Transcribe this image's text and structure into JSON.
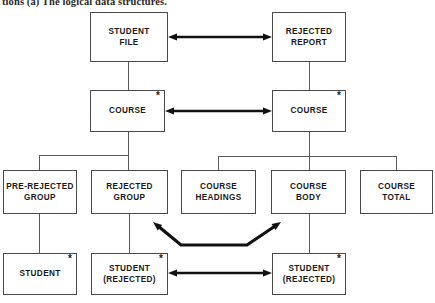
{
  "caption": "tions (a) The logical data structures.",
  "diagram": {
    "title": "The logical data structures",
    "type": "jackson-structure-diagram",
    "star_glyph": "*",
    "colors": {
      "box_border": "#4a4a4a",
      "wire": "#5a5a5a",
      "arrow": "#111111",
      "text": "#1a1a1a",
      "background": "#ffffff"
    },
    "nodes": [
      {
        "id": "student-file",
        "label_lines": [
          "STUDENT",
          "FILE"
        ],
        "star": false,
        "x": 90,
        "y": 12,
        "w": 78,
        "h": 50
      },
      {
        "id": "rejected-report",
        "label_lines": [
          "REJECTED",
          "REPORT"
        ],
        "star": false,
        "x": 272,
        "y": 12,
        "w": 74,
        "h": 50
      },
      {
        "id": "course-left",
        "label_lines": [
          "COURSE"
        ],
        "star": true,
        "x": 90,
        "y": 90,
        "w": 75,
        "h": 42
      },
      {
        "id": "course-right",
        "label_lines": [
          "COURSE"
        ],
        "star": true,
        "x": 272,
        "y": 90,
        "w": 74,
        "h": 42
      },
      {
        "id": "pre-rejected-group",
        "label_lines": [
          "PRE-REJECTED",
          "GROUP"
        ],
        "star": false,
        "x": 3,
        "y": 170,
        "w": 74,
        "h": 44
      },
      {
        "id": "rejected-group",
        "label_lines": [
          "REJECTED",
          "GROUP"
        ],
        "star": false,
        "x": 91,
        "y": 170,
        "w": 77,
        "h": 44
      },
      {
        "id": "course-headings",
        "label_lines": [
          "COURSE",
          "HEADINGS"
        ],
        "star": false,
        "x": 181,
        "y": 170,
        "w": 75,
        "h": 44
      },
      {
        "id": "course-body",
        "label_lines": [
          "COURSE",
          "BODY"
        ],
        "star": false,
        "x": 271,
        "y": 170,
        "w": 75,
        "h": 44
      },
      {
        "id": "course-total",
        "label_lines": [
          "COURSE",
          "TOTAL"
        ],
        "star": false,
        "x": 360,
        "y": 170,
        "w": 73,
        "h": 44
      },
      {
        "id": "student",
        "label_lines": [
          "STUDENT"
        ],
        "star": true,
        "x": 3,
        "y": 253,
        "w": 74,
        "h": 42
      },
      {
        "id": "student-rejected-l",
        "label_lines": [
          "STUDENT",
          "(REJECTED)"
        ],
        "star": true,
        "x": 91,
        "y": 253,
        "w": 77,
        "h": 42
      },
      {
        "id": "student-rejected-r",
        "label_lines": [
          "STUDENT",
          "(REJECTED)"
        ],
        "star": true,
        "x": 272,
        "y": 253,
        "w": 74,
        "h": 42
      }
    ],
    "arrows": [
      {
        "id": "arrow-student-file-rejected-report",
        "from": "student-file",
        "to": "rejected-report",
        "style": "straight-double",
        "x1": 168,
        "y1": 37,
        "x2": 272,
        "y2": 37
      },
      {
        "id": "arrow-course-course",
        "from": "course-left",
        "to": "course-right",
        "style": "straight-double",
        "x1": 165,
        "y1": 111,
        "x2": 272,
        "y2": 111
      },
      {
        "id": "arrow-student-rejected-pair",
        "from": "student-rejected-l",
        "to": "student-rejected-r",
        "style": "straight-double",
        "x1": 168,
        "y1": 273,
        "x2": 272,
        "y2": 273
      },
      {
        "id": "arrow-rejected-group-course-body",
        "from": "rejected-group",
        "to": "course-body",
        "style": "bent-double",
        "points": "153,222 181,245 247,245 281,222"
      }
    ],
    "connectors": [
      {
        "id": "wire-student-file-down",
        "type": "v",
        "x": 128,
        "y": 62,
        "len": 28
      },
      {
        "id": "wire-rejected-report-down",
        "type": "v",
        "x": 309,
        "y": 62,
        "len": 28
      },
      {
        "id": "wire-course-left-down",
        "type": "v",
        "x": 128,
        "y": 132,
        "len": 38
      },
      {
        "id": "wire-course-left-bus",
        "type": "h",
        "x": 39,
        "y": 155,
        "len": 89
      },
      {
        "id": "wire-pre-rejected-group-up",
        "type": "v",
        "x": 39,
        "y": 155,
        "len": 15
      },
      {
        "id": "wire-course-right-down",
        "type": "v",
        "x": 309,
        "y": 132,
        "len": 38
      },
      {
        "id": "wire-course-right-bus",
        "type": "h",
        "x": 218,
        "y": 156,
        "len": 178
      },
      {
        "id": "wire-course-headings-up",
        "type": "v",
        "x": 218,
        "y": 156,
        "len": 14
      },
      {
        "id": "wire-course-total-up",
        "type": "v",
        "x": 396,
        "y": 156,
        "len": 14
      },
      {
        "id": "wire-pre-rejected-to-student",
        "type": "v",
        "x": 39,
        "y": 214,
        "len": 39
      },
      {
        "id": "wire-rejected-to-student",
        "type": "v",
        "x": 129,
        "y": 214,
        "len": 39
      },
      {
        "id": "wire-course-body-to-student",
        "type": "v",
        "x": 309,
        "y": 214,
        "len": 39
      }
    ]
  }
}
